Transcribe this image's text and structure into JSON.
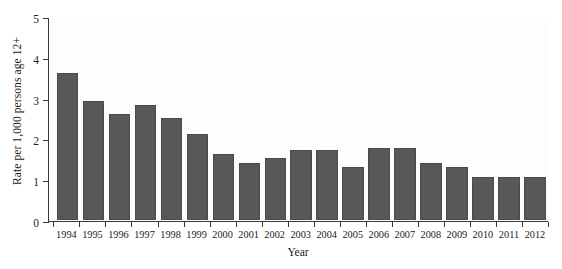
{
  "chart_data": {
    "type": "bar",
    "title": "",
    "xlabel": "Year",
    "ylabel": "Rate per 1,000 persons age 12+",
    "categories": [
      "1994",
      "1995",
      "1996",
      "1997",
      "1998",
      "1999",
      "2000",
      "2001",
      "2002",
      "2003",
      "2004",
      "2005",
      "2006",
      "2007",
      "2008",
      "2009",
      "2010",
      "2011",
      "2012"
    ],
    "values": [
      3.6,
      2.9,
      2.6,
      2.8,
      2.5,
      2.1,
      1.6,
      1.4,
      1.5,
      1.7,
      1.7,
      1.3,
      1.75,
      1.75,
      1.4,
      1.3,
      1.05,
      1.05,
      1.05
    ],
    "ylim": [
      0,
      5
    ],
    "yticks": [
      "0",
      "1",
      "2",
      "3",
      "4",
      "5"
    ],
    "ytick_values": [
      0,
      1,
      2,
      3,
      4,
      5
    ],
    "grid": false,
    "legend": "none",
    "bar_color": "#585858",
    "axis_color": "#3a3a3a",
    "background_color": "#ffffff"
  }
}
